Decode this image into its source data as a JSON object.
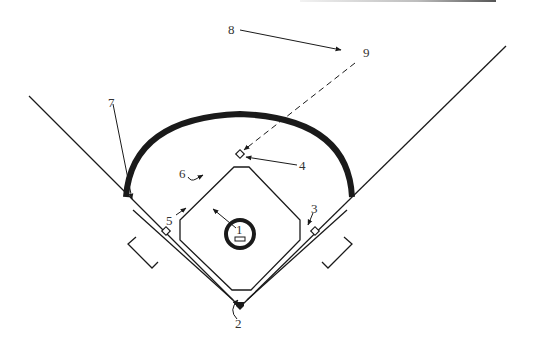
{
  "figure": {
    "type": "baseball-field-diagram",
    "colors": {
      "line": "#1a1a1a",
      "label": "#333333",
      "background": "#ffffff"
    }
  },
  "labels": [
    {
      "id": "1",
      "text": "1",
      "refers_to": "pitchers-mound"
    },
    {
      "id": "2",
      "text": "2",
      "refers_to": "home-plate"
    },
    {
      "id": "3",
      "text": "3",
      "refers_to": "first-base"
    },
    {
      "id": "4",
      "text": "4",
      "refers_to": "second-base"
    },
    {
      "id": "5",
      "text": "5",
      "refers_to": "third-base"
    },
    {
      "id": "6",
      "text": "6",
      "refers_to": "infield-grass"
    },
    {
      "id": "7",
      "text": "7",
      "refers_to": "outfield-arc-left-end"
    },
    {
      "id": "8",
      "text": "8",
      "refers_to": "trajectory-arrow"
    },
    {
      "id": "9",
      "text": "9",
      "refers_to": "dashed-path-origin"
    }
  ]
}
